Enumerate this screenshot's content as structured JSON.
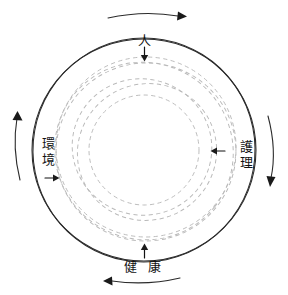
{
  "figure": {
    "type": "concept-diagram",
    "background_color": "#ffffff",
    "solid_stroke_color": "#2b2b2b",
    "dashed_stroke_color": "#b9b9b9",
    "arrow_color": "#1a1a1a",
    "center": {
      "x": 144,
      "y": 150
    },
    "outer_radius": 112
  },
  "labels": {
    "top": {
      "name": "person",
      "text": "人",
      "orientation": "horizontal",
      "position": "top"
    },
    "right": {
      "name": "nursing",
      "chars": [
        "護",
        "理"
      ],
      "text": "護理",
      "orientation": "vertical",
      "position": "right"
    },
    "bottom": {
      "name": "health",
      "text": "健 康",
      "orientation": "horizontal",
      "position": "bottom"
    },
    "left": {
      "name": "environment",
      "chars": [
        "環",
        "境"
      ],
      "text": "環境",
      "orientation": "vertical",
      "position": "left"
    }
  },
  "rotation_arrows": [
    {
      "name": "top-rotation-arrow",
      "position": "top",
      "direction": "right",
      "meaning": "clockwise"
    },
    {
      "name": "right-rotation-arrow",
      "position": "right",
      "direction": "down",
      "meaning": "clockwise"
    },
    {
      "name": "bottom-rotation-arrow",
      "position": "bottom",
      "direction": "left",
      "meaning": "clockwise"
    },
    {
      "name": "left-rotation-arrow",
      "position": "left",
      "direction": "up",
      "meaning": "clockwise"
    }
  ],
  "inward_arrows": [
    {
      "name": "person-inward-arrow",
      "position": "top",
      "direction": "down"
    },
    {
      "name": "nursing-inward-arrow",
      "position": "right",
      "direction": "left"
    },
    {
      "name": "health-inward-arrow",
      "position": "bottom",
      "direction": "up"
    },
    {
      "name": "environment-inward-arrow",
      "position": "left",
      "direction": "right"
    }
  ],
  "circles": {
    "solid": [
      {
        "cx": 144,
        "cy": 150,
        "r": 112,
        "rot": 0
      },
      {
        "cx": 144,
        "cy": 150,
        "r": 112,
        "rot": 9
      }
    ],
    "dashed": [
      {
        "cx": 146,
        "cy": 148,
        "r": 90,
        "rot": 0
      },
      {
        "cx": 142,
        "cy": 153,
        "r": 90,
        "rot": 40
      },
      {
        "cx": 147,
        "cy": 152,
        "r": 90,
        "rot": 80
      },
      {
        "cx": 143,
        "cy": 148,
        "r": 68,
        "rot": 20
      },
      {
        "cx": 145,
        "cy": 151,
        "r": 68,
        "rot": 62
      },
      {
        "cx": 144,
        "cy": 150,
        "r": 55,
        "rot": 0
      }
    ]
  }
}
